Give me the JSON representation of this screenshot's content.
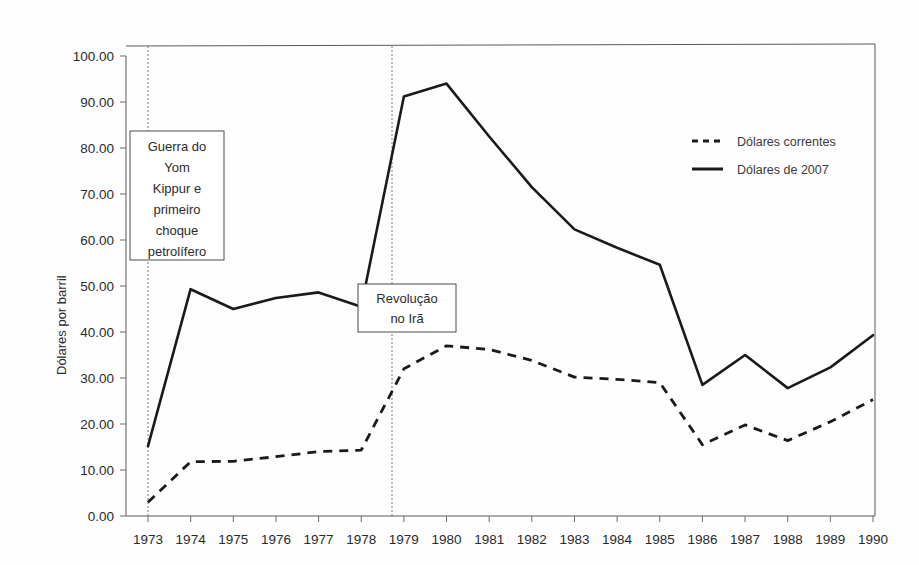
{
  "chart_data": {
    "type": "line",
    "title": "",
    "xlabel": "",
    "ylabel": "Dólares por barril",
    "categories": [
      "1973",
      "1974",
      "1975",
      "1976",
      "1977",
      "1978",
      "1979",
      "1980",
      "1981",
      "1982",
      "1983",
      "1984",
      "1985",
      "1986",
      "1987",
      "1988",
      "1989",
      "1990"
    ],
    "ylim": [
      0,
      100
    ],
    "xlim": [
      1973,
      1990
    ],
    "y_ticks": [
      "0.00",
      "10.00",
      "20.00",
      "30.00",
      "40.00",
      "50.00",
      "60.00",
      "70.00",
      "80.00",
      "90.00",
      "100.00"
    ],
    "y_tick_values": [
      0,
      10,
      20,
      30,
      40,
      50,
      60,
      70,
      80,
      90,
      100
    ],
    "grid": false,
    "legend_position": "top-right",
    "series": [
      {
        "name": "Dólares correntes",
        "style": "dashed",
        "values": [
          3.0,
          11.8,
          11.9,
          12.9,
          14.0,
          14.3,
          32.0,
          37.0,
          36.2,
          33.8,
          30.2,
          29.7,
          29.0,
          15.5,
          19.8,
          16.4,
          20.5,
          25.3
        ]
      },
      {
        "name": "Dólares de 2007",
        "style": "solid",
        "values": [
          15.2,
          49.3,
          45.0,
          47.4,
          48.6,
          45.5,
          91.2,
          94.0,
          82.5,
          71.5,
          62.3,
          58.3,
          54.6,
          28.5,
          35.0,
          27.8,
          32.3,
          39.3
        ]
      }
    ],
    "annotations": [
      {
        "id": "yom-kippur",
        "text_lines": [
          "Guerra do",
          "Yom",
          "Kippur e",
          "primeiro",
          "choque",
          "petrolífero"
        ],
        "at_year": "1973"
      },
      {
        "id": "iran-revolution",
        "text_lines": [
          "Revolução",
          "no Irã"
        ],
        "at_year": "1979"
      }
    ]
  },
  "colors": {
    "line": "#1a1a1a",
    "axis": "#5a5a5a",
    "text": "#2b2b2b",
    "background": "#fefefe"
  }
}
